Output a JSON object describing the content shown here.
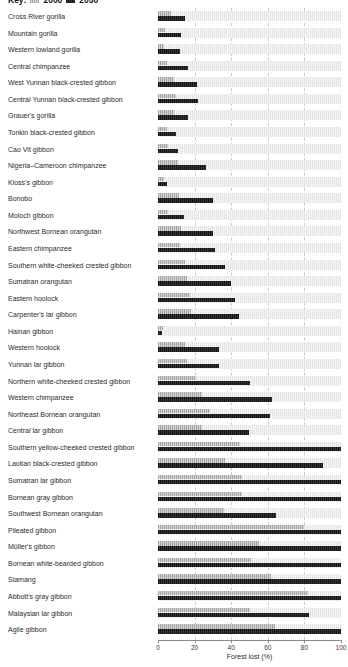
{
  "legend": {
    "prefix": "Key:",
    "items": [
      {
        "label": "2000",
        "swatch_color": "#a3a3a3",
        "hatched": true
      },
      {
        "label": "2050",
        "swatch_color": "#141414",
        "hatched": true
      }
    ]
  },
  "axis": {
    "label": "Forest lost (%)",
    "ticks": [
      "0",
      "20",
      "40",
      "60",
      "80",
      "100"
    ],
    "min": 0,
    "max": 100
  },
  "chart_data": {
    "type": "bar",
    "orientation": "horizontal",
    "title": "",
    "xlabel": "Forest lost (%)",
    "ylabel": "",
    "xlim": [
      0,
      100
    ],
    "grid": "dashed vertical lines at 20/40/60/80",
    "legend_position": "top-left (clipped)",
    "track_color": "#e4e4e4",
    "categories": [
      "Cross River gorilla",
      "Mountain gorilla",
      "Western lowland gorilla",
      "Central chimpanzee",
      "West Yunnan black-crested gibbon",
      "Central Yunnan black-crested gibbon",
      "Grauer's gorilla",
      "Tonkin black-crested gibbon",
      "Cao Vit gibbon",
      "Nigeria–Cameroon chimpanzee",
      "Kloss's gibbon",
      "Bonobo",
      "Moloch gibbon",
      "Northwest Bornean orangutan",
      "Eastern chimpanzee",
      "Southern white-cheeked crested gibbon",
      "Sumatran orangutan",
      "Eastern hoolock",
      "Carpenter's lar gibbon",
      "Hainan gibbon",
      "Western hoolock",
      "Yunnan lar gibbon",
      "Northern white-cheeked crested gibbon",
      "Western chimpanzee",
      "Northeast Bornean orangutan",
      "Central lar gibbon",
      "Southern yellow-cheeked crested gibbon",
      "Laotian black-crested gibbon",
      "Sumatran lar gibbon",
      "Bornean gray gibbon",
      "Southwest Bornean orangutan",
      "Pileated gibbon",
      "Müller's gibbon",
      "Bornean white-bearded gibbon",
      "Siamang",
      "Abbott's gray gibbon",
      "Malaysian lar gibbon",
      "Agile gibbon"
    ],
    "series": [
      {
        "name": "2000",
        "color": "#a3a3a3",
        "values": [
          7,
          4,
          3.5,
          5,
          8.5,
          10,
          8.5,
          5,
          5.5,
          11,
          3.5,
          11.5,
          5.5,
          12.5,
          12,
          15,
          16,
          17.5,
          18,
          3,
          15,
          16,
          21,
          24,
          28.5,
          24,
          45,
          36.5,
          46,
          46,
          36,
          80,
          55,
          51,
          62,
          82,
          50,
          64
        ]
      },
      {
        "name": "2050",
        "color": "#141414",
        "values": [
          14.5,
          12.5,
          12,
          16.5,
          21.5,
          22,
          16.5,
          10,
          11,
          26,
          5,
          30,
          14,
          30,
          31,
          36.5,
          40,
          42,
          44,
          2,
          33.5,
          33.5,
          50,
          62.5,
          61,
          49.5,
          100,
          90,
          100,
          100,
          64.5,
          100,
          100,
          100,
          100,
          100,
          82.5,
          100
        ]
      }
    ]
  }
}
